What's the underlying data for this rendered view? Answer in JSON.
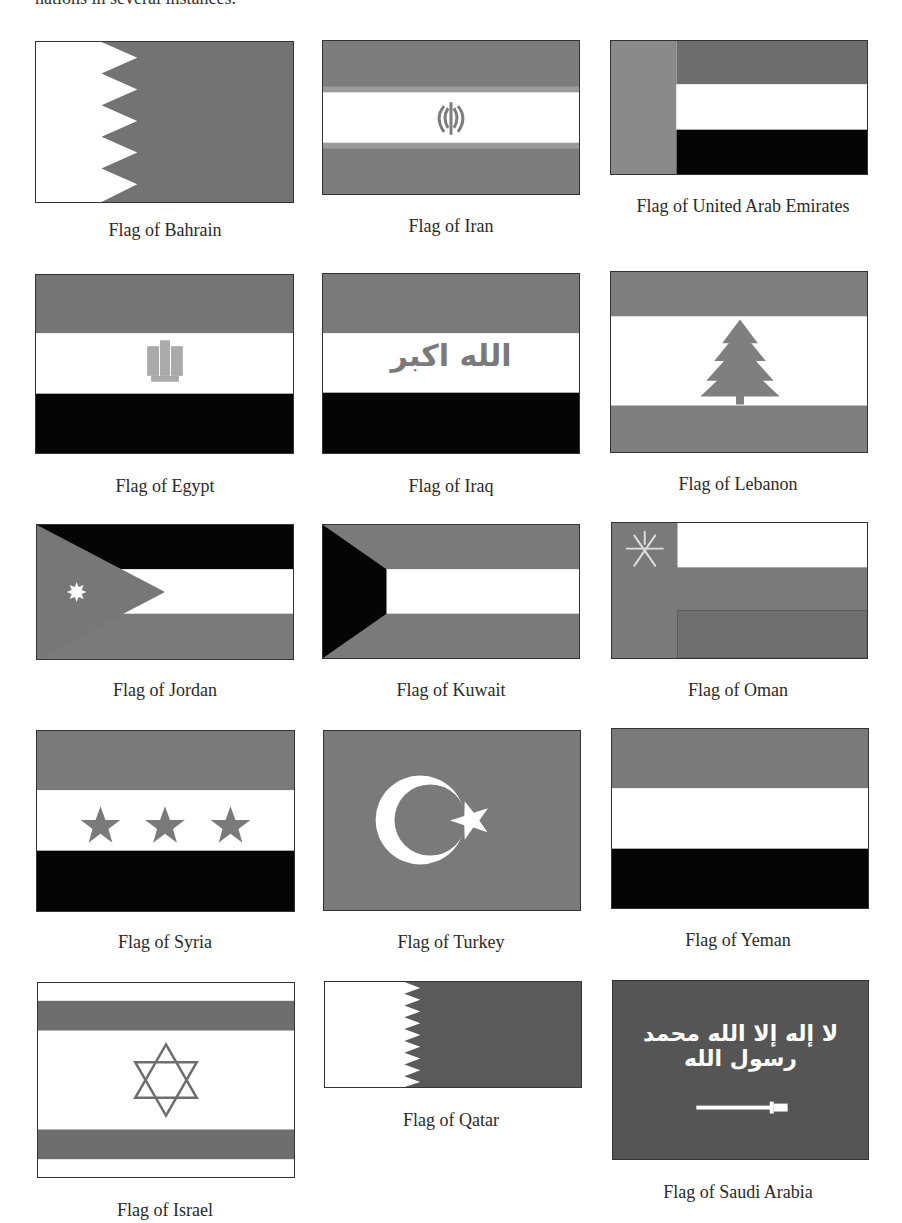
{
  "page": {
    "top_text_partial": "nations in several instances.",
    "colors": {
      "gray": "#7a7a7a",
      "dark": "#555555",
      "black": "#050505",
      "white": "#ffffff"
    }
  },
  "flags": [
    {
      "id": "bahrain",
      "caption": "Flag of Bahrain"
    },
    {
      "id": "iran",
      "caption": "Flag of Iran"
    },
    {
      "id": "uae",
      "caption": "Flag of United Arab Emirates"
    },
    {
      "id": "egypt",
      "caption": "Flag of Egypt"
    },
    {
      "id": "iraq",
      "caption": "Flag of Iraq",
      "emblem_text": "الله اكبر"
    },
    {
      "id": "lebanon",
      "caption": "Flag of Lebanon"
    },
    {
      "id": "jordan",
      "caption": "Flag of Jordan"
    },
    {
      "id": "kuwait",
      "caption": "Flag of Kuwait"
    },
    {
      "id": "oman",
      "caption": "Flag of Oman"
    },
    {
      "id": "syria",
      "caption": "Flag of Syria"
    },
    {
      "id": "turkey",
      "caption": "Flag of Turkey"
    },
    {
      "id": "yemen",
      "caption": "Flag of Yeman"
    },
    {
      "id": "israel",
      "caption": "Flag of Israel"
    },
    {
      "id": "qatar",
      "caption": "Flag of Qatar"
    },
    {
      "id": "saudi",
      "caption": "Flag of Saudi Arabia",
      "emblem_text": "لا إله إلا الله محمد رسول الله"
    }
  ]
}
